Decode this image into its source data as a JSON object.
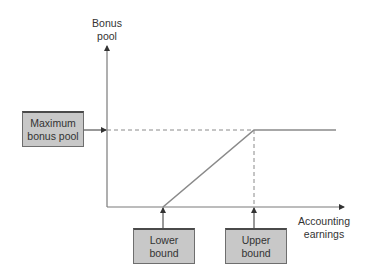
{
  "diagram": {
    "y_axis": {
      "label_line1": "Bonus",
      "label_line2": "pool"
    },
    "x_axis": {
      "label_line1": "Accounting",
      "label_line2": "earnings"
    },
    "boxes": {
      "max_bonus": {
        "line1": "Maximum",
        "line2": "bonus pool"
      },
      "lower_bound": {
        "line1": "Lower",
        "line2": "bound"
      },
      "upper_bound": {
        "line1": "Upper",
        "line2": "bound"
      }
    },
    "colors": {
      "box_fill": "#c8c8c8",
      "box_border": "#4a4a4a",
      "axis": "#7a7a7a",
      "curve": "#8a8a8a",
      "dashed": "#8a8a8a"
    }
  }
}
